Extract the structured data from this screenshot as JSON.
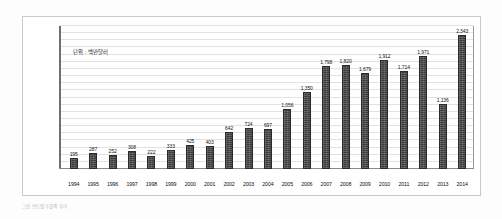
{
  "figure": {
    "unit_label": "단위 : 백만달러",
    "caption": "그림    연도별 수출액 추이"
  },
  "chart_data": {
    "type": "bar",
    "title": "",
    "subtitle": "",
    "xlabel": "",
    "ylabel": "",
    "unit": "백만달러",
    "grid": true,
    "legend": "none",
    "ylim": [
      0,
      2500
    ],
    "categories": [
      "1994",
      "1995",
      "1996",
      "1997",
      "1998",
      "1999",
      "2000",
      "2001",
      "2002",
      "2003",
      "2004",
      "2005",
      "2006",
      "2007",
      "2008",
      "2009",
      "2010",
      "2011",
      "2012",
      "2013",
      "2014"
    ],
    "values": [
      195,
      287,
      252,
      308,
      222,
      333,
      425,
      403,
      642,
      724,
      697,
      1056,
      1350,
      1798,
      1820,
      1679,
      1912,
      1714,
      1971,
      1136,
      2343
    ],
    "value_labels": [
      "195",
      "287",
      "252",
      "308",
      "222",
      "333",
      "425",
      "403",
      "642",
      "724",
      "697",
      "1,056",
      "1,350",
      "1,798",
      "1,820",
      "1,679",
      "1,912",
      "1,714",
      "1,971",
      "1,136",
      "2,343"
    ],
    "series": [
      {
        "name": "수출액",
        "color": "#3c3c3c",
        "values": [
          195,
          287,
          252,
          308,
          222,
          333,
          425,
          403,
          642,
          724,
          697,
          1056,
          1350,
          1798,
          1820,
          1679,
          1912,
          1714,
          1971,
          1136,
          2343
        ]
      }
    ]
  },
  "colors": {
    "bar": "#3c3c3c",
    "bar_border": "#2a2a2a",
    "gridline": "#e2e2e2",
    "axis": "#6f6f6f",
    "frame": "#c9c9c9",
    "text": "#121212"
  }
}
